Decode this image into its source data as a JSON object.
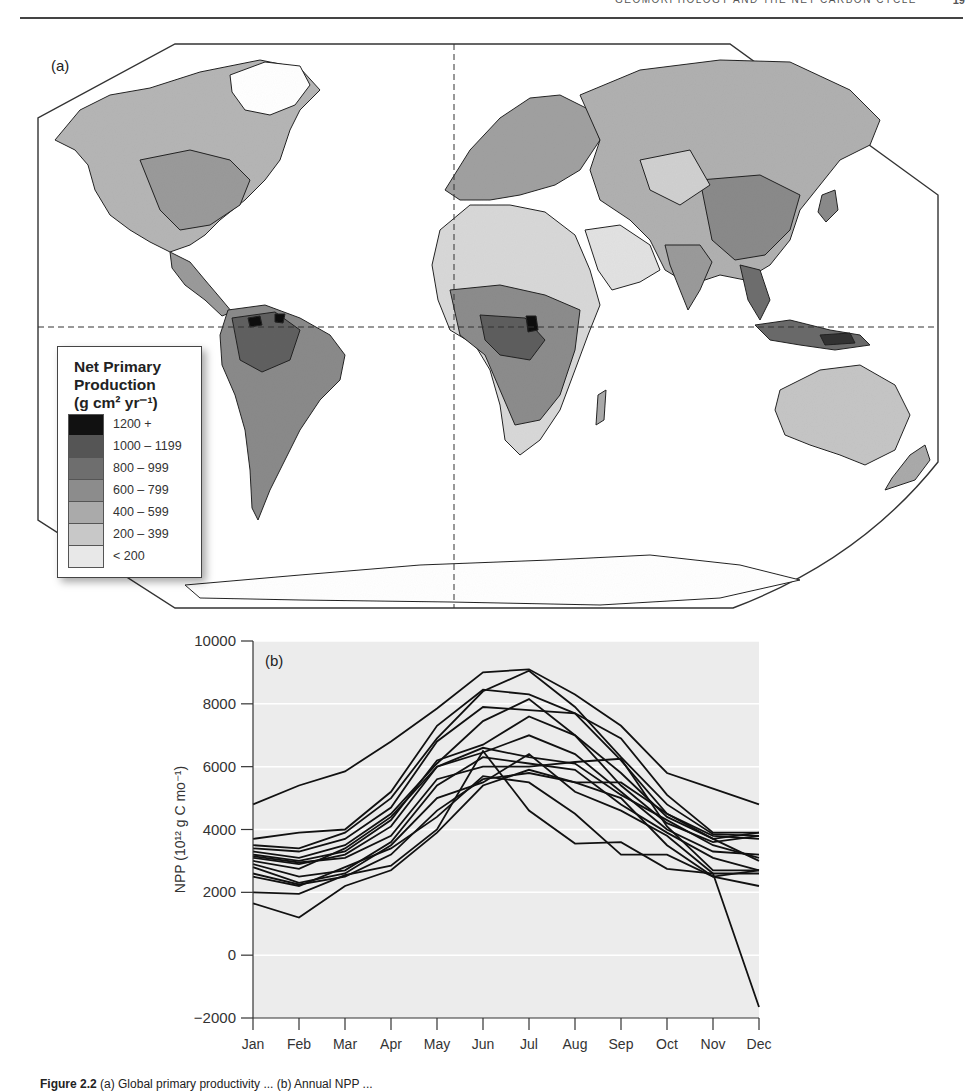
{
  "header": {
    "running_title": "GEOMORPHOLOGY AND THE NET CARBON CYCLE",
    "page_number": "19"
  },
  "panel_a": {
    "label": "(a)",
    "legend": {
      "title_lines": [
        "Net Primary",
        "Production",
        "(g cm² yr⁻¹)"
      ],
      "classes": [
        {
          "label": "1200 +",
          "color": "#111111"
        },
        {
          "label": "1000 – 1199",
          "color": "#555555"
        },
        {
          "label": "800 – 999",
          "color": "#6e6e6e"
        },
        {
          "label": "600 – 799",
          "color": "#8c8c8c"
        },
        {
          "label": "400 – 599",
          "color": "#aaaaaa"
        },
        {
          "label": "200 – 399",
          "color": "#c8c8c8"
        },
        {
          "label": "< 200",
          "color": "#e8e8e8"
        }
      ]
    }
  },
  "panel_b": {
    "label": "(b)"
  },
  "caption": {
    "prefix": "Figure 2.2",
    "text": "(a) Global primary productivity ... (b) Annual NPP ... "
  },
  "chart_data": {
    "type": "line",
    "title": "(b)",
    "xlabel": "",
    "ylabel": "NPP (10¹² g C mo⁻¹)",
    "categories": [
      "Jan",
      "Feb",
      "Mar",
      "Apr",
      "May",
      "Jun",
      "Jul",
      "Aug",
      "Sep",
      "Oct",
      "Nov",
      "Dec"
    ],
    "ylim": [
      -2000,
      10000
    ],
    "yticks": [
      -2000,
      0,
      2000,
      4000,
      6000,
      8000,
      10000
    ],
    "grid": true,
    "legend": "none",
    "series": [
      {
        "name": "model 1",
        "values": [
          4800,
          5400,
          5850,
          6800,
          7850,
          9000,
          9100,
          8300,
          7300,
          5800,
          5300,
          4800
        ]
      },
      {
        "name": "model 2",
        "values": [
          3700,
          3900,
          4000,
          5200,
          7300,
          8450,
          8300,
          7700,
          6900,
          5100,
          3900,
          3900
        ]
      },
      {
        "name": "model 3",
        "values": [
          3500,
          3400,
          3900,
          5000,
          6900,
          8400,
          9050,
          7900,
          6300,
          4800,
          3850,
          3800
        ]
      },
      {
        "name": "model 4",
        "values": [
          3400,
          3300,
          3700,
          4700,
          6800,
          7900,
          7800,
          7700,
          6200,
          4500,
          3800,
          3700
        ]
      },
      {
        "name": "model 5",
        "values": [
          3300,
          3100,
          3500,
          4500,
          6100,
          7450,
          8150,
          7000,
          5800,
          4400,
          3700,
          3900
        ]
      },
      {
        "name": "model 6",
        "values": [
          3200,
          3000,
          3300,
          4300,
          6200,
          6700,
          7600,
          7000,
          5400,
          4200,
          3600,
          3800
        ]
      },
      {
        "name": "model 7",
        "values": [
          3100,
          2900,
          3200,
          4100,
          6000,
          6450,
          7000,
          6400,
          5200,
          4000,
          3300,
          3200
        ]
      },
      {
        "name": "model 8",
        "values": [
          3000,
          2750,
          3400,
          4400,
          6000,
          6600,
          6300,
          6100,
          5100,
          4300,
          3500,
          3100
        ]
      },
      {
        "name": "model 9",
        "values": [
          2900,
          2500,
          2700,
          3600,
          5400,
          6300,
          6100,
          5900,
          4800,
          3900,
          3100,
          2700
        ]
      },
      {
        "name": "model 10",
        "values": [
          2800,
          2300,
          2600,
          3500,
          5000,
          5500,
          6400,
          5200,
          4600,
          3800,
          2600,
          2600
        ]
      },
      {
        "name": "model 11",
        "values": [
          2600,
          2250,
          2500,
          3200,
          4600,
          5600,
          5800,
          5500,
          5000,
          3500,
          2500,
          2700
        ]
      },
      {
        "name": "model 12",
        "values": [
          2500,
          2200,
          2800,
          3400,
          4400,
          5700,
          5500,
          4500,
          3200,
          3200,
          2500,
          2200
        ]
      },
      {
        "name": "model 13",
        "values": [
          2000,
          1950,
          2550,
          2850,
          4000,
          6500,
          4600,
          3550,
          3600,
          2750,
          2600,
          -1650
        ]
      },
      {
        "name": "model 14",
        "values": [
          1650,
          1200,
          2200,
          2700,
          3900,
          5400,
          5900,
          5500,
          5500,
          4500,
          3700,
          3000
        ]
      },
      {
        "name": "model 15",
        "values": [
          3150,
          2950,
          3100,
          3800,
          5600,
          6000,
          6000,
          6150,
          6250,
          4100,
          2700,
          2700
        ]
      }
    ]
  }
}
